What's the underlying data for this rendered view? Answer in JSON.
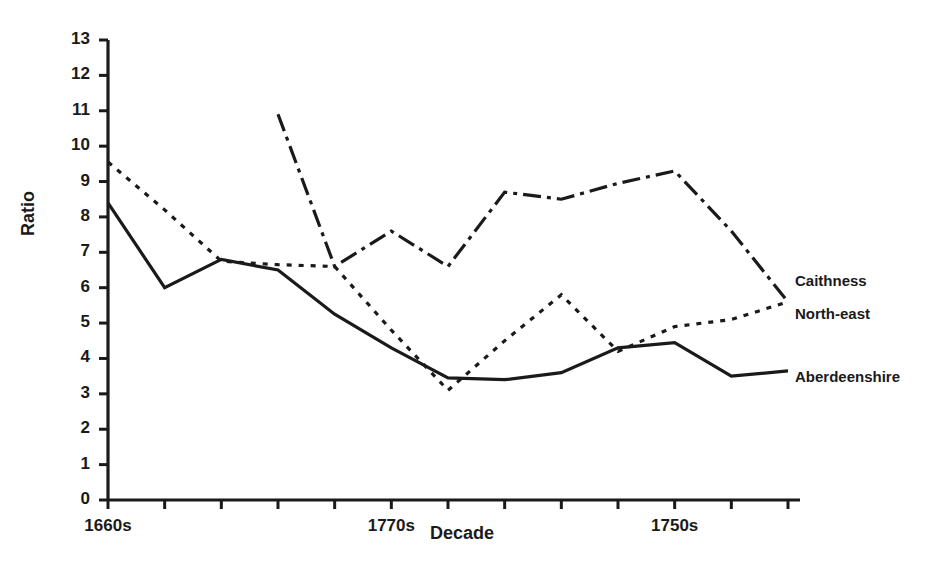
{
  "chart_data": {
    "type": "line",
    "title": "",
    "xlabel": "Decade",
    "ylabel": "Ratio",
    "ylim": [
      0,
      13
    ],
    "yticks": [
      0,
      1,
      2,
      3,
      4,
      5,
      6,
      7,
      8,
      9,
      10,
      11,
      12,
      13
    ],
    "grid": false,
    "legend_position": "right-inline",
    "x_tick_count": 13,
    "x_tick_labels_shown": [
      "1660s",
      "1770s",
      "1750s"
    ],
    "x_tick_label_positions": [
      0,
      5,
      10
    ],
    "x_index": [
      0,
      1,
      2,
      3,
      4,
      5,
      6,
      7,
      8,
      9,
      10,
      11,
      12
    ],
    "series": [
      {
        "name": "Aberdeenshire",
        "style": "solid",
        "color": "#1a1a1a",
        "x": [
          0,
          1,
          2,
          3,
          4,
          5,
          6,
          7,
          8,
          9,
          10,
          11,
          12
        ],
        "values": [
          8.4,
          6.0,
          6.8,
          6.5,
          5.25,
          4.3,
          3.45,
          3.4,
          3.6,
          4.3,
          4.45,
          3.5,
          3.65
        ]
      },
      {
        "name": "North-east",
        "style": "dotted",
        "color": "#1a1a1a",
        "x": [
          0,
          1,
          2,
          3,
          4,
          5,
          6,
          7,
          8,
          9,
          10,
          11,
          12
        ],
        "values": [
          9.55,
          8.2,
          6.75,
          6.65,
          6.6,
          4.8,
          3.1,
          4.5,
          5.8,
          4.2,
          4.9,
          5.1,
          5.6
        ]
      },
      {
        "name": "Caithness",
        "style": "dash-dot",
        "color": "#1a1a1a",
        "x": [
          3,
          4,
          5,
          6,
          7,
          8,
          9,
          10,
          11,
          12
        ],
        "values": [
          10.9,
          6.6,
          7.6,
          6.6,
          8.7,
          8.5,
          8.95,
          9.3,
          7.6,
          5.6
        ]
      }
    ],
    "annotations": [
      {
        "text": "Caithness",
        "x_px": 795,
        "y_px": 282
      },
      {
        "text": "North-east",
        "x_px": 795,
        "y_px": 315
      },
      {
        "text": "Aberdeenshire",
        "x_px": 795,
        "y_px": 378
      }
    ]
  },
  "axes": {
    "y_title": "Ratio",
    "x_title": "Decade",
    "y_tick_labels": [
      "13",
      "12",
      "11",
      "10",
      "9",
      "8",
      "7",
      "6",
      "5",
      "4",
      "3",
      "2",
      "1",
      "0"
    ],
    "x_tick_labels": [
      "1660s",
      "1770s",
      "1750s"
    ]
  }
}
